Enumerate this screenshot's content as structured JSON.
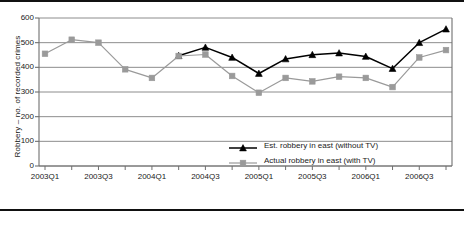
{
  "chart_data": {
    "type": "line",
    "title": "",
    "xlabel": "",
    "ylabel": "Robbery – no. of recorded crimes",
    "ylim": [
      0,
      600
    ],
    "yticks": [
      0,
      100,
      200,
      300,
      400,
      500,
      600
    ],
    "grid": "horizontal",
    "legend_position": "inside-bottom-right",
    "x": [
      "2003Q1",
      "2003Q2",
      "2003Q3",
      "2003Q4",
      "2004Q1",
      "2004Q2",
      "2004Q3",
      "2004Q4",
      "2005Q1",
      "2005Q2",
      "2005Q3",
      "2005Q4",
      "2006Q1",
      "2006Q2",
      "2006Q3",
      "2006Q4"
    ],
    "xtick_labels": [
      "2003Q1",
      "2003Q3",
      "2004Q1",
      "2004Q3",
      "2005Q1",
      "2005Q3",
      "2006Q1",
      "2006Q3"
    ],
    "xtick_indices": [
      0,
      2,
      4,
      6,
      8,
      10,
      12,
      14
    ],
    "series": [
      {
        "name": "Est. robbery in east (without TV)",
        "color": "#000000",
        "marker": "triangle",
        "values": [
          null,
          null,
          null,
          null,
          null,
          447,
          481,
          440,
          375,
          434,
          451,
          458,
          444,
          395,
          500,
          555
        ]
      },
      {
        "name": "Actual robbery in east (with TV)",
        "color": "#9a9a9a",
        "marker": "square",
        "values": [
          455,
          512,
          500,
          392,
          357,
          446,
          452,
          365,
          297,
          357,
          343,
          362,
          357,
          320,
          440,
          470
        ]
      }
    ]
  },
  "legend": {
    "items": [
      {
        "label": "Est. robbery in east (without TV)",
        "color": "#000000",
        "marker": "triangle"
      },
      {
        "label": "Actual robbery in east (with TV)",
        "color": "#9a9a9a",
        "marker": "square"
      }
    ]
  },
  "axis": {
    "y_title": "Robbery – no. of recorded crimes",
    "y_labels": [
      "600",
      "500",
      "400",
      "300",
      "200",
      "100",
      "0"
    ],
    "x_labels": [
      "2003Q1",
      "2003Q3",
      "2004Q1",
      "2004Q3",
      "2005Q1",
      "2005Q3",
      "2006Q1",
      "2006Q3"
    ]
  },
  "colors": {
    "estimated_series": "#000000",
    "actual_series": "#9a9a9a",
    "gridline": "#808080",
    "frame_rule": "#111111"
  }
}
